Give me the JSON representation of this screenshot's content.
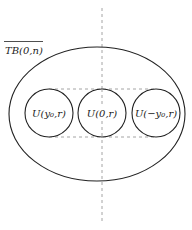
{
  "diagram": {
    "title_label": "TB(0,n)",
    "title_overline": true,
    "outer_set": {
      "shape": "ellipse",
      "cx": 97,
      "cy": 114,
      "rx": 88,
      "ry": 67,
      "stroke": "#222222"
    },
    "circles": [
      {
        "label": "U(y₀,r)",
        "cx": 49,
        "cy": 113,
        "r": 24
      },
      {
        "label": "U(0,r)",
        "cx": 102,
        "cy": 113,
        "r": 24
      },
      {
        "label": "U(−y₀,r)",
        "cx": 156,
        "cy": 113,
        "r": 24
      }
    ],
    "dashed_lines": {
      "vertical_axis": {
        "x": 102,
        "y1": 8,
        "y2": 222
      },
      "top_tangent": {
        "y": 89,
        "x1": 49,
        "x2": 156
      },
      "bottom_tangent": {
        "y": 137,
        "x1": 49,
        "x2": 156
      }
    },
    "colors": {
      "stroke": "#222222",
      "dash": "#9a9a9a",
      "background": "#ffffff"
    }
  }
}
